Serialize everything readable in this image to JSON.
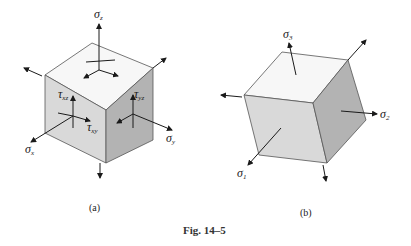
{
  "figure": {
    "caption": "Fig. 14–5",
    "panel_a": {
      "label": "(a)",
      "stresses": {
        "sigma_z": {
          "sym": "σ",
          "sub": "z"
        },
        "sigma_x": {
          "sym": "σ",
          "sub": "x"
        },
        "sigma_y": {
          "sym": "σ",
          "sub": "y"
        },
        "tau_xz": {
          "sym": "τ",
          "sub": "xz"
        },
        "tau_xy": {
          "sym": "τ",
          "sub": "xy"
        },
        "tau_yz": {
          "sym": "τ",
          "sub": "yz"
        }
      }
    },
    "panel_b": {
      "label": "(b)",
      "stresses": {
        "sigma_1": {
          "sym": "σ",
          "sub": "1"
        },
        "sigma_2": {
          "sym": "σ",
          "sub": "2"
        },
        "sigma_3": {
          "sym": "σ",
          "sub": "3"
        }
      }
    }
  },
  "colors": {
    "top_face": "#f7f7f7",
    "front_face": "#d9d9d9",
    "side_face": "#b3b3b3",
    "edge": "#555555",
    "arrow": "#1a1a1a"
  }
}
